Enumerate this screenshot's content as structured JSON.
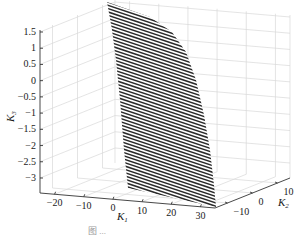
{
  "chart_data": {
    "type": "surface3d",
    "title": "",
    "axes": {
      "x": {
        "label": "K",
        "subscript": "1",
        "ticks": [
          -20,
          -10,
          0,
          10,
          20,
          30
        ],
        "tick_labels": [
          "−20",
          "−10",
          "0",
          "10",
          "20",
          "30"
        ],
        "range": [
          -25,
          35
        ]
      },
      "y": {
        "label": "K",
        "subscript": "2",
        "ticks": [
          -10,
          0,
          10
        ],
        "tick_labels": [
          "−10",
          "0",
          "10"
        ],
        "range": [
          -15,
          15
        ]
      },
      "z": {
        "label": "K",
        "subscript": "3",
        "ticks": [
          1.5,
          1,
          0.5,
          0,
          -0.5,
          -1,
          -1.5,
          -2,
          -2.5,
          -3
        ],
        "tick_labels": [
          "1.5",
          "1",
          "0.5",
          "0",
          "−0.5",
          "−1",
          "−1.5",
          "−2",
          "−2.5",
          "−3"
        ],
        "range": [
          -3.3,
          1.6
        ]
      }
    },
    "grid": true,
    "legend": null,
    "surface_color": "#2a2a2a",
    "grid_color": "#d9d9d9",
    "caption": "图 ..."
  }
}
